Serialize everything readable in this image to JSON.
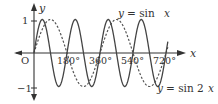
{
  "chart_data": {
    "type": "line",
    "title": "",
    "xlabel": "x",
    "ylabel": "y",
    "origin_label": "O",
    "x_unit": "degrees",
    "xlim": [
      -20,
      735
    ],
    "ylim": [
      -1.2,
      1.3
    ],
    "x_ticks": [
      180,
      360,
      540,
      720
    ],
    "x_tick_labels": [
      "180°",
      "360°",
      "540°",
      "720°"
    ],
    "y_ticks": [
      1,
      -1
    ],
    "y_tick_labels": [
      "1",
      "−1"
    ],
    "grid": false,
    "series": [
      {
        "name": "y = sin x",
        "function": "sin(x)",
        "style": "dashed",
        "color": "#444444",
        "x_range": [
          0,
          730
        ],
        "annotation": "y = sin x",
        "key_points": {
          "x": [
            0,
            90,
            180,
            270,
            360,
            450,
            540,
            630,
            720
          ],
          "y": [
            0,
            1,
            0,
            -1,
            0,
            1,
            0,
            -1,
            0
          ]
        }
      },
      {
        "name": "y = sin 2x",
        "function": "sin(2x)",
        "style": "solid",
        "color": "#444444",
        "x_range": [
          0,
          730
        ],
        "annotation": "y = sin 2x",
        "key_points": {
          "x": [
            0,
            45,
            90,
            135,
            180,
            225,
            270,
            315,
            360,
            405,
            450,
            495,
            540,
            585,
            630,
            675,
            720
          ],
          "y": [
            0,
            1,
            0,
            -1,
            0,
            1,
            0,
            -1,
            0,
            1,
            0,
            -1,
            0,
            1,
            0,
            -1,
            0
          ]
        }
      }
    ],
    "annotations": [
      {
        "text": "y = sin x",
        "position": "top-right"
      },
      {
        "text": "y = sin 2x",
        "position": "bottom-right"
      }
    ]
  },
  "labels": {
    "y_axis": "y",
    "x_axis": "x",
    "origin": "O",
    "tick_1": "1",
    "tick_neg1": "−1",
    "x180": "180°",
    "x360": "360°",
    "x540": "540°",
    "x720": "720°",
    "sinx_y": "y",
    "sinx_eq": "= sin",
    "sinx_x": "x",
    "sin2x_y": "y",
    "sin2x_eq": "= sin 2",
    "sin2x_x": "x"
  }
}
